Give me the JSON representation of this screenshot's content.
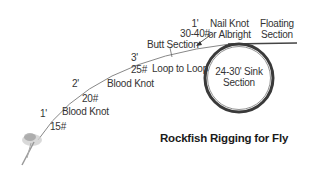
{
  "diagram": {
    "title": "Rockfish Rigging for Fly",
    "sections": {
      "butt": {
        "length": "1'",
        "weight": "30-40#",
        "name": "Butt Section"
      },
      "mid": {
        "length": "3'",
        "weight": "25#"
      },
      "second": {
        "length": "2'",
        "weight": "20#"
      },
      "tippet": {
        "length": "1'",
        "weight": "15#"
      }
    },
    "knots": {
      "nail": "Nail Knot",
      "nail_alt": "or Albright",
      "loop": "Loop to Loop",
      "blood1": "Blood Knot",
      "blood2": "Blood Knot"
    },
    "floating": {
      "line1": "Floating",
      "line2": "Section"
    },
    "sink": {
      "line1": "24-30' Sink",
      "line2": "Section"
    },
    "colors": {
      "line": "#555555",
      "circle": "#3a3a3a",
      "text": "#333333"
    }
  }
}
